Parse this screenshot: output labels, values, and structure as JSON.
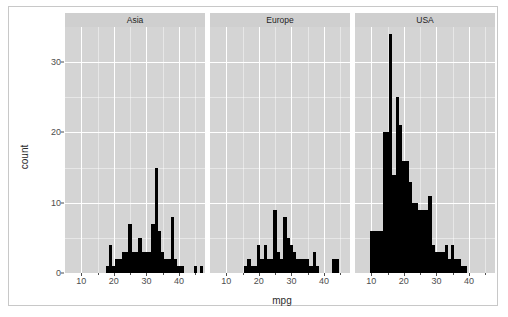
{
  "chart_data": {
    "type": "bar",
    "subtype": "histogram-faceted",
    "title": "",
    "xlabel": "mpg",
    "ylabel": "count",
    "xlim": [
      5,
      48
    ],
    "ylim": [
      0,
      35
    ],
    "x_ticks": [
      10,
      20,
      30,
      40
    ],
    "y_ticks": [
      0,
      10,
      20,
      30
    ],
    "x_minor_ticks": [
      15,
      25,
      35,
      45
    ],
    "y_minor_ticks": [
      5,
      15,
      25
    ],
    "grid": true,
    "legend": "none",
    "bin_width": 1,
    "facet_variable": "origin",
    "panels": [
      {
        "label": "Asia",
        "bins": [
          {
            "x": 18,
            "count": 1
          },
          {
            "x": 19,
            "count": 4
          },
          {
            "x": 20,
            "count": 1
          },
          {
            "x": 21,
            "count": 2
          },
          {
            "x": 22,
            "count": 2
          },
          {
            "x": 23,
            "count": 3
          },
          {
            "x": 24,
            "count": 3
          },
          {
            "x": 25,
            "count": 7
          },
          {
            "x": 26,
            "count": 3
          },
          {
            "x": 27,
            "count": 3
          },
          {
            "x": 28,
            "count": 5
          },
          {
            "x": 29,
            "count": 3
          },
          {
            "x": 30,
            "count": 3
          },
          {
            "x": 31,
            "count": 3
          },
          {
            "x": 32,
            "count": 7
          },
          {
            "x": 33,
            "count": 15
          },
          {
            "x": 34,
            "count": 6
          },
          {
            "x": 35,
            "count": 3
          },
          {
            "x": 36,
            "count": 2
          },
          {
            "x": 37,
            "count": 2
          },
          {
            "x": 38,
            "count": 8
          },
          {
            "x": 39,
            "count": 2
          },
          {
            "x": 40,
            "count": 1
          },
          {
            "x": 41,
            "count": 1
          },
          {
            "x": 45,
            "count": 1
          },
          {
            "x": 47,
            "count": 1
          }
        ]
      },
      {
        "label": "Europe",
        "bins": [
          {
            "x": 16,
            "count": 1
          },
          {
            "x": 17,
            "count": 2
          },
          {
            "x": 18,
            "count": 1
          },
          {
            "x": 19,
            "count": 1
          },
          {
            "x": 20,
            "count": 4
          },
          {
            "x": 21,
            "count": 2
          },
          {
            "x": 22,
            "count": 4
          },
          {
            "x": 23,
            "count": 2
          },
          {
            "x": 24,
            "count": 2
          },
          {
            "x": 25,
            "count": 9
          },
          {
            "x": 26,
            "count": 3
          },
          {
            "x": 27,
            "count": 2
          },
          {
            "x": 28,
            "count": 8
          },
          {
            "x": 29,
            "count": 5
          },
          {
            "x": 30,
            "count": 4
          },
          {
            "x": 31,
            "count": 3
          },
          {
            "x": 32,
            "count": 2
          },
          {
            "x": 33,
            "count": 2
          },
          {
            "x": 34,
            "count": 2
          },
          {
            "x": 35,
            "count": 2
          },
          {
            "x": 36,
            "count": 1
          },
          {
            "x": 37,
            "count": 3
          },
          {
            "x": 38,
            "count": 1
          },
          {
            "x": 43,
            "count": 2
          },
          {
            "x": 44,
            "count": 2
          }
        ]
      },
      {
        "label": "USA",
        "bins": [
          {
            "x": 10,
            "count": 6
          },
          {
            "x": 11,
            "count": 6
          },
          {
            "x": 12,
            "count": 6
          },
          {
            "x": 13,
            "count": 6
          },
          {
            "x": 14,
            "count": 20
          },
          {
            "x": 15,
            "count": 20
          },
          {
            "x": 16,
            "count": 34
          },
          {
            "x": 17,
            "count": 14
          },
          {
            "x": 18,
            "count": 25
          },
          {
            "x": 19,
            "count": 21
          },
          {
            "x": 20,
            "count": 16
          },
          {
            "x": 21,
            "count": 16
          },
          {
            "x": 22,
            "count": 13
          },
          {
            "x": 23,
            "count": 10
          },
          {
            "x": 24,
            "count": 10
          },
          {
            "x": 25,
            "count": 9
          },
          {
            "x": 26,
            "count": 9
          },
          {
            "x": 27,
            "count": 9
          },
          {
            "x": 28,
            "count": 11
          },
          {
            "x": 29,
            "count": 4
          },
          {
            "x": 30,
            "count": 3
          },
          {
            "x": 31,
            "count": 3
          },
          {
            "x": 32,
            "count": 3
          },
          {
            "x": 33,
            "count": 4
          },
          {
            "x": 34,
            "count": 2
          },
          {
            "x": 35,
            "count": 4
          },
          {
            "x": 36,
            "count": 2
          },
          {
            "x": 37,
            "count": 2
          },
          {
            "x": 38,
            "count": 1
          },
          {
            "x": 39,
            "count": 1
          }
        ]
      }
    ]
  },
  "axis": {
    "y_title": "count",
    "x_title": "mpg",
    "y_tick_labels": [
      "0",
      "10",
      "20",
      "30"
    ],
    "x_tick_labels": [
      "10",
      "20",
      "30",
      "40"
    ]
  },
  "style": {
    "panel_background": "#d4d4d4",
    "strip_background": "#cfcfcf",
    "grid_color": "#ffffff",
    "bar_color": "#000000",
    "text_color": "#4d4d4d",
    "frame_border": "#c8c8c8",
    "page_background": "#ffffff"
  }
}
